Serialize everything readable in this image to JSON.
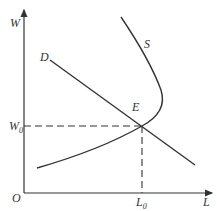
{
  "diagram": {
    "axes": {
      "y_label": "W",
      "x_label": "L",
      "origin": "O"
    },
    "curves": [
      {
        "name": "D",
        "description": "labor demand, downward sloping"
      },
      {
        "name": "S",
        "description": "backward-bending labor supply"
      }
    ],
    "equilibrium": {
      "point": "E",
      "wage": "W",
      "wage_sub": "0",
      "quantity": "L",
      "quantity_sub": "0"
    },
    "colors": {
      "line": "#333333",
      "background": "#ffffff"
    }
  }
}
